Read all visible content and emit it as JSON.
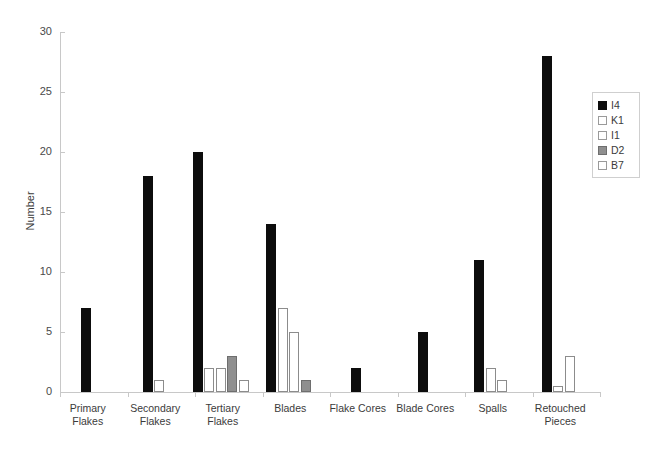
{
  "chart_data": {
    "type": "bar",
    "title": "",
    "xlabel": "",
    "ylabel": "Number",
    "ylim": [
      0,
      30
    ],
    "yticks": [
      0,
      5,
      10,
      15,
      20,
      25,
      30
    ],
    "grid": false,
    "legend_position": "right",
    "categories": [
      "Primary Flakes",
      "Secondary Flakes",
      "Tertiary Flakes",
      "Blades",
      "Flake Cores",
      "Blade Cores",
      "Spalls",
      "Retouched Pieces"
    ],
    "series": [
      {
        "name": "I4",
        "color": "#0d0d0d",
        "fill": "black",
        "values": [
          7,
          18,
          20,
          14,
          2,
          5,
          11,
          28
        ]
      },
      {
        "name": "K1",
        "color": "#ffffff",
        "fill": "white",
        "values": [
          0,
          1,
          2,
          7,
          0,
          0,
          2,
          0.5
        ]
      },
      {
        "name": "I1",
        "color": "#ffffff",
        "fill": "white",
        "values": [
          0,
          0,
          2,
          5,
          0,
          0,
          1,
          3
        ]
      },
      {
        "name": "D2",
        "color": "#8f8f8f",
        "fill": "gray",
        "values": [
          0,
          0,
          3,
          1,
          0,
          0,
          0,
          0
        ]
      },
      {
        "name": "B7",
        "color": "#ffffff",
        "fill": "white",
        "values": [
          0,
          0,
          1,
          0,
          0,
          0,
          0,
          0
        ]
      }
    ]
  },
  "legend": {
    "items": [
      {
        "label": "I4",
        "fill": "black"
      },
      {
        "label": "K1",
        "fill": "white"
      },
      {
        "label": "I1",
        "fill": "white"
      },
      {
        "label": "D2",
        "fill": "gray"
      },
      {
        "label": "B7",
        "fill": "white"
      }
    ]
  }
}
